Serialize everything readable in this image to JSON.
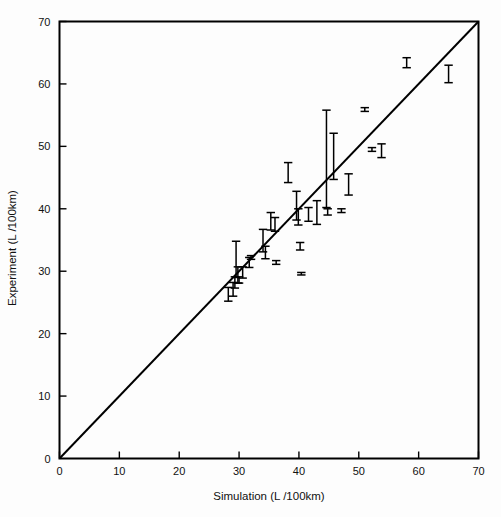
{
  "chart_data": {
    "type": "scatter",
    "title": "",
    "subtitle": "",
    "xlabel": "Simulation (L /100km)",
    "ylabel": "Experiment (L /100km)",
    "xlim": [
      0,
      70
    ],
    "ylim": [
      0,
      70
    ],
    "xticks": [
      0,
      10,
      20,
      30,
      40,
      50,
      60,
      70
    ],
    "yticks": [
      0,
      10,
      20,
      30,
      40,
      50,
      60,
      70
    ],
    "xtick_labels": [
      "0",
      "10",
      "20",
      "30",
      "40",
      "50",
      "60",
      "70"
    ],
    "ytick_labels": [
      "0",
      "10",
      "20",
      "30",
      "40",
      "50",
      "60",
      "70"
    ],
    "grid": false,
    "legend": null,
    "legend_position": "none",
    "annotations": [
      {
        "name": "identity-line",
        "description": "1:1 diagonal reference line y = x",
        "from": [
          0,
          0
        ],
        "to": [
          70,
          70
        ]
      }
    ],
    "marker_style": "vertical error bar with horizontal end caps",
    "series": [
      {
        "name": "Experiment vs Simulation",
        "points": [
          {
            "x": 28.2,
            "y": 26.3,
            "yerr_low": 25.2,
            "yerr_high": 27.4
          },
          {
            "x": 29.0,
            "y": 27.1,
            "yerr_low": 26.0,
            "yerr_high": 28.2
          },
          {
            "x": 29.3,
            "y": 28.2,
            "yerr_low": 27.3,
            "yerr_high": 29.1
          },
          {
            "x": 29.5,
            "y": 31.9,
            "yerr_low": 29.0,
            "yerr_high": 34.8
          },
          {
            "x": 29.8,
            "y": 29.4,
            "yerr_low": 28.1,
            "yerr_high": 30.7
          },
          {
            "x": 30.0,
            "y": 28.6,
            "yerr_low": 28.1,
            "yerr_high": 29.1
          },
          {
            "x": 30.6,
            "y": 29.8,
            "yerr_low": 28.9,
            "yerr_high": 30.7
          },
          {
            "x": 31.7,
            "y": 31.4,
            "yerr_low": 30.6,
            "yerr_high": 32.2
          },
          {
            "x": 32.0,
            "y": 32.2,
            "yerr_low": 31.9,
            "yerr_high": 32.5
          },
          {
            "x": 34.0,
            "y": 34.9,
            "yerr_low": 33.1,
            "yerr_high": 36.7
          },
          {
            "x": 34.4,
            "y": 33.0,
            "yerr_low": 32.0,
            "yerr_high": 34.0
          },
          {
            "x": 35.3,
            "y": 38.0,
            "yerr_low": 36.6,
            "yerr_high": 39.4
          },
          {
            "x": 36.0,
            "y": 37.5,
            "yerr_low": 36.4,
            "yerr_high": 38.6
          },
          {
            "x": 36.2,
            "y": 31.4,
            "yerr_low": 31.1,
            "yerr_high": 31.7
          },
          {
            "x": 38.2,
            "y": 45.8,
            "yerr_low": 44.2,
            "yerr_high": 47.4
          },
          {
            "x": 39.6,
            "y": 40.5,
            "yerr_low": 38.2,
            "yerr_high": 42.8
          },
          {
            "x": 39.9,
            "y": 38.7,
            "yerr_low": 37.4,
            "yerr_high": 40.0
          },
          {
            "x": 40.2,
            "y": 34.0,
            "yerr_low": 33.4,
            "yerr_high": 34.6
          },
          {
            "x": 40.4,
            "y": 29.6,
            "yerr_low": 29.4,
            "yerr_high": 29.8
          },
          {
            "x": 41.6,
            "y": 39.1,
            "yerr_low": 38.0,
            "yerr_high": 40.2
          },
          {
            "x": 43.0,
            "y": 39.4,
            "yerr_low": 37.5,
            "yerr_high": 41.3
          },
          {
            "x": 44.6,
            "y": 48.0,
            "yerr_low": 40.2,
            "yerr_high": 55.8
          },
          {
            "x": 44.8,
            "y": 39.5,
            "yerr_low": 39.0,
            "yerr_high": 40.0
          },
          {
            "x": 45.8,
            "y": 48.4,
            "yerr_low": 44.7,
            "yerr_high": 52.1
          },
          {
            "x": 47.1,
            "y": 39.7,
            "yerr_low": 39.4,
            "yerr_high": 40.0
          },
          {
            "x": 48.3,
            "y": 43.9,
            "yerr_low": 42.2,
            "yerr_high": 45.6
          },
          {
            "x": 51.0,
            "y": 55.9,
            "yerr_low": 55.6,
            "yerr_high": 56.2
          },
          {
            "x": 52.2,
            "y": 49.5,
            "yerr_low": 49.2,
            "yerr_high": 49.8
          },
          {
            "x": 53.8,
            "y": 49.3,
            "yerr_low": 48.2,
            "yerr_high": 50.4
          },
          {
            "x": 58.0,
            "y": 63.4,
            "yerr_low": 62.6,
            "yerr_high": 64.2
          },
          {
            "x": 65.0,
            "y": 61.6,
            "yerr_low": 60.2,
            "yerr_high": 63.0
          }
        ]
      }
    ]
  },
  "colors": {
    "foreground": "#000000",
    "background": "#ffffff",
    "marker": "#000000",
    "identity_line": "#000000"
  }
}
